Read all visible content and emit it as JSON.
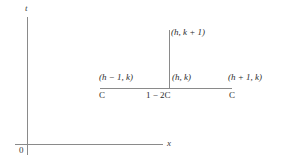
{
  "figure": {
    "axes": {
      "vertical_label": "t",
      "horizontal_label": "x",
      "origin_label": "0"
    },
    "stencil": {
      "nodes": [
        {
          "id": "top",
          "label": "(h, k + 1)",
          "coefficient": ""
        },
        {
          "id": "left",
          "label": "(h − 1, k)",
          "coefficient": "C"
        },
        {
          "id": "center",
          "label": "(h, k)",
          "coefficient": "1 − 2C"
        },
        {
          "id": "right",
          "label": "(h + 1, k)",
          "coefficient": "C"
        }
      ]
    },
    "colors": {
      "line": "#8a8a8a",
      "text": "#2b2b2b",
      "background": "#ffffff"
    }
  }
}
